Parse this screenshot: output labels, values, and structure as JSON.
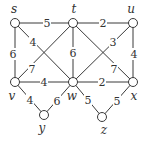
{
  "graph": {
    "nodes": [
      {
        "id": "s",
        "label": "s",
        "x": 15,
        "y": 23,
        "lx": 14,
        "ly": 9
      },
      {
        "id": "t",
        "label": "t",
        "x": 73,
        "y": 23,
        "lx": 74,
        "ly": 9
      },
      {
        "id": "u",
        "label": "u",
        "x": 133,
        "y": 23,
        "lx": 131,
        "ly": 9
      },
      {
        "id": "v",
        "label": "v",
        "x": 15,
        "y": 82,
        "lx": 12,
        "ly": 96
      },
      {
        "id": "w",
        "label": "w",
        "x": 73,
        "y": 82,
        "lx": 72,
        "ly": 96
      },
      {
        "id": "x",
        "label": "x",
        "x": 133,
        "y": 82,
        "lx": 134,
        "ly": 96
      },
      {
        "id": "y",
        "label": "y",
        "x": 44,
        "y": 115,
        "lx": 42,
        "ly": 128
      },
      {
        "id": "z",
        "label": "z",
        "x": 102,
        "y": 117,
        "lx": 104,
        "ly": 130
      }
    ],
    "edges": [
      {
        "from": "s",
        "to": "t",
        "weight": "5",
        "lx": 47,
        "ly": 23
      },
      {
        "from": "t",
        "to": "u",
        "weight": "2",
        "lx": 103,
        "ly": 23
      },
      {
        "from": "s",
        "to": "v",
        "weight": "6",
        "lx": 13,
        "ly": 54
      },
      {
        "from": "s",
        "to": "w",
        "weight": "4",
        "lx": 33,
        "ly": 42
      },
      {
        "from": "t",
        "to": "v",
        "weight": "7",
        "lx": 32,
        "ly": 69
      },
      {
        "from": "t",
        "to": "w",
        "weight": "6",
        "lx": 73,
        "ly": 53
      },
      {
        "from": "t",
        "to": "x",
        "weight": "7",
        "lx": 114,
        "ly": 69
      },
      {
        "from": "u",
        "to": "w",
        "weight": "3",
        "lx": 113,
        "ly": 42
      },
      {
        "from": "u",
        "to": "x",
        "weight": "4",
        "lx": 134,
        "ly": 54
      },
      {
        "from": "v",
        "to": "w",
        "weight": "4",
        "lx": 44,
        "ly": 82
      },
      {
        "from": "w",
        "to": "x",
        "weight": "2",
        "lx": 102,
        "ly": 82
      },
      {
        "from": "v",
        "to": "y",
        "weight": "4",
        "lx": 30,
        "ly": 100
      },
      {
        "from": "y",
        "to": "w",
        "weight": "6",
        "lx": 57,
        "ly": 101
      },
      {
        "from": "w",
        "to": "z",
        "weight": "5",
        "lx": 88,
        "ly": 100
      },
      {
        "from": "z",
        "to": "x",
        "weight": "5",
        "lx": 117,
        "ly": 101
      }
    ]
  },
  "colors": {
    "stroke": "#3a3a3a",
    "text": "#333333",
    "background": "#ffffff"
  }
}
